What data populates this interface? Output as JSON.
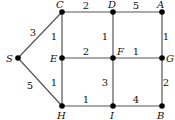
{
  "graph": {
    "type": "weighted-undirected",
    "nodes": [
      {
        "id": "S",
        "label": "S",
        "x": 18,
        "y": 58,
        "lx": 6,
        "ly": 62
      },
      {
        "id": "C",
        "label": "C",
        "x": 62,
        "y": 12,
        "lx": 56,
        "ly": 8
      },
      {
        "id": "D",
        "label": "D",
        "x": 113,
        "y": 12,
        "lx": 108,
        "ly": 8
      },
      {
        "id": "A",
        "label": "A",
        "x": 162,
        "y": 12,
        "lx": 157,
        "ly": 8
      },
      {
        "id": "E",
        "label": "E",
        "x": 62,
        "y": 58,
        "lx": 50,
        "ly": 62
      },
      {
        "id": "F",
        "label": "F",
        "x": 113,
        "y": 58,
        "lx": 117,
        "ly": 55
      },
      {
        "id": "G",
        "label": "G",
        "x": 162,
        "y": 58,
        "lx": 166,
        "ly": 62
      },
      {
        "id": "H",
        "label": "H",
        "x": 62,
        "y": 106,
        "lx": 57,
        "ly": 119
      },
      {
        "id": "I",
        "label": "I",
        "x": 113,
        "y": 106,
        "lx": 110,
        "ly": 119
      },
      {
        "id": "B",
        "label": "B",
        "x": 162,
        "y": 106,
        "lx": 157,
        "ly": 119
      }
    ],
    "edges": [
      {
        "from": "S",
        "to": "C",
        "weight": "3",
        "wx": 33,
        "wy": 36
      },
      {
        "from": "S",
        "to": "H",
        "weight": "5",
        "wx": 30,
        "wy": 89
      },
      {
        "from": "C",
        "to": "D",
        "weight": "2",
        "wx": 86,
        "wy": 9
      },
      {
        "from": "D",
        "to": "A",
        "weight": "5",
        "wx": 136,
        "wy": 9
      },
      {
        "from": "C",
        "to": "E",
        "weight": "1",
        "wx": 54,
        "wy": 40
      },
      {
        "from": "D",
        "to": "F",
        "weight": "1",
        "wx": 105,
        "wy": 40
      },
      {
        "from": "A",
        "to": "G",
        "weight": "1",
        "wx": 166,
        "wy": 40
      },
      {
        "from": "E",
        "to": "F",
        "weight": "2",
        "wx": 86,
        "wy": 55
      },
      {
        "from": "F",
        "to": "G",
        "weight": "1",
        "wx": 136,
        "wy": 55
      },
      {
        "from": "E",
        "to": "H",
        "weight": "1",
        "wx": 54,
        "wy": 86
      },
      {
        "from": "F",
        "to": "I",
        "weight": "3",
        "wx": 105,
        "wy": 86
      },
      {
        "from": "G",
        "to": "B",
        "weight": "2",
        "wx": 166,
        "wy": 86
      },
      {
        "from": "H",
        "to": "I",
        "weight": "1",
        "wx": 86,
        "wy": 103
      },
      {
        "from": "I",
        "to": "B",
        "weight": "4",
        "wx": 136,
        "wy": 103
      }
    ]
  }
}
